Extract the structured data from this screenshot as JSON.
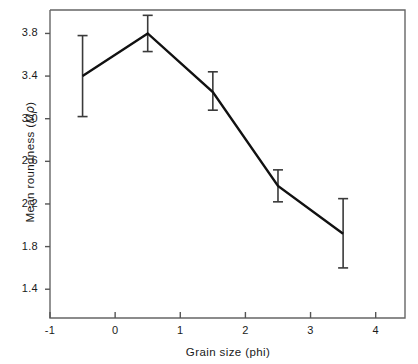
{
  "chart_data": {
    "type": "line",
    "title": "",
    "xlabel": "Grain size (phi)",
    "ylabel": "Mean roundness (Mρ)",
    "xlim": [
      -1,
      4.45
    ],
    "ylim": [
      1.13,
      4.02
    ],
    "grid": false,
    "legend": null,
    "x": [
      -0.5,
      0.5,
      1.5,
      2.5,
      3.5
    ],
    "values": [
      3.4,
      3.8,
      3.25,
      2.37,
      1.92
    ],
    "error_low": [
      3.02,
      3.63,
      3.08,
      2.22,
      1.6
    ],
    "error_high": [
      3.78,
      3.97,
      3.44,
      2.52,
      2.25
    ],
    "xticks": [
      -1,
      0,
      1,
      2,
      3,
      4
    ],
    "xticklabels": [
      "-1",
      "0",
      "1",
      "2",
      "3",
      "4"
    ],
    "yticks": [
      1.4,
      1.8,
      2.2,
      2.6,
      3.0,
      3.4,
      3.8
    ],
    "yticklabels": [
      "1.4",
      "1.8",
      "2.2",
      "2.6",
      "3.0",
      "3.4",
      "3.8"
    ],
    "line_color": "#111111",
    "errorbar_color": "#3a3a3a",
    "axis_color": "#555555",
    "background": "#ffffff"
  },
  "axes": {
    "y_title_prefix": "Mean roundness (",
    "y_title_m": "M",
    "y_title_rho": "ρ",
    "y_title_suffix": ")",
    "x_title": "Grain size (phi)"
  }
}
